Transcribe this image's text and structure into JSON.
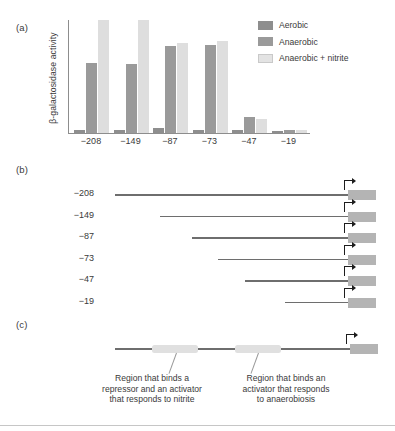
{
  "panels": {
    "a": "(a)",
    "b": "(b)",
    "c": "(c)"
  },
  "chart_data": {
    "type": "bar",
    "title": "",
    "xlabel": "",
    "ylabel": "β-galactosidase activity",
    "categories": [
      "−208",
      "−149",
      "−87",
      "−73",
      "−47",
      "−19"
    ],
    "grid": false,
    "legend_position": "top-right",
    "ylim": [
      0,
      100
    ],
    "axis_ticks_shown": false,
    "series": [
      {
        "name": "Aerobic",
        "color": "#8e8e8e",
        "values": [
          3,
          3,
          4,
          3,
          3,
          2
        ]
      },
      {
        "name": "Anaerobic",
        "color": "#9a9a9a",
        "values": [
          62,
          61,
          77,
          78,
          14,
          3
        ]
      },
      {
        "name": "Anaerobic + nitrite",
        "color": "#dedede",
        "values": [
          100,
          100,
          80,
          81,
          12,
          3
        ]
      }
    ]
  },
  "constructs": {
    "labels": [
      "−208",
      "−149",
      "−87",
      "−73",
      "−47",
      "−19"
    ],
    "gene_box_color": "#b4b4b4",
    "line_color": "#6e6e6e",
    "arrow_icon": "transcription-start-arrow"
  },
  "map": {
    "regions": [
      {
        "label": "Region that binds a\nrepressor and an activator\nthat responds to nitrite",
        "color": "#e0e0e0"
      },
      {
        "label": "Region that binds an\nactivator that responds\nto anaerobiosis",
        "color": "#e0e0e0"
      }
    ],
    "caption_left_line1": "Region that binds a",
    "caption_left_line2": "repressor and an activator",
    "caption_left_line3": "that responds to nitrite",
    "caption_right_line1": "Region that binds an",
    "caption_right_line2": "activator that responds",
    "caption_right_line3": "to anaerobiosis"
  }
}
